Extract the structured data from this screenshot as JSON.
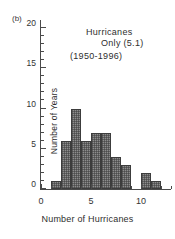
{
  "panel": {
    "label": "(b)"
  },
  "annotations": {
    "line1": "Hurricanes",
    "line2": "Only (5.1)",
    "line3": "(1950-1996)"
  },
  "axes": {
    "x_title": "Number of Hurricanes",
    "y_title": "Number of Years",
    "x_ticks": [
      "0",
      "5",
      "10"
    ],
    "y_ticks": [
      "0",
      "5",
      "10",
      "15",
      "20"
    ]
  },
  "chart_data": {
    "type": "bar",
    "title": "",
    "subtitle": "Hurricanes Only (5.1) (1950-1996)",
    "xlabel": "Number of Hurricanes",
    "ylabel": "Number of Years",
    "categories": [
      2,
      3,
      4,
      5,
      6,
      7,
      8,
      9,
      10,
      11,
      12
    ],
    "values": [
      1,
      6,
      10,
      6,
      7,
      7,
      4,
      3,
      0,
      2,
      1
    ],
    "xlim": [
      0,
      13
    ],
    "ylim": [
      0,
      21
    ],
    "x_tick_values": [
      0,
      5,
      10
    ],
    "y_tick_values": [
      0,
      5,
      10,
      15,
      20
    ],
    "x_minor_tick_values": [
      1,
      2,
      3,
      4,
      6,
      7,
      8,
      9,
      11,
      12,
      13
    ],
    "y_minor_tick_values": [
      1,
      2,
      3,
      4,
      6,
      7,
      8,
      9,
      11,
      12,
      13,
      14,
      16,
      17,
      18,
      19
    ],
    "bar_width": 1,
    "grid": false,
    "legend": null,
    "bar_fill": "#8d8d8d",
    "bar_edge": "#3c3c3c",
    "mean": 5.1,
    "period": "1950-1996"
  }
}
